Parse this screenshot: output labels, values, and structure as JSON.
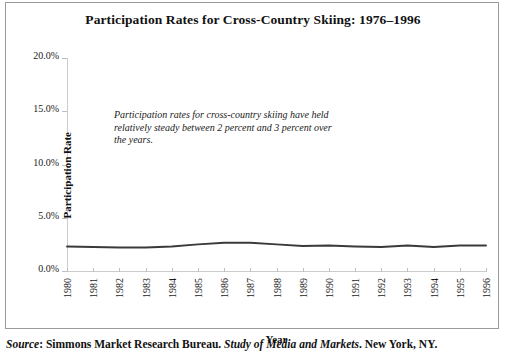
{
  "chart_data": {
    "type": "line",
    "title": "Participation Rates for Cross-Country Skiing: 1976–1996",
    "xlabel": "Year",
    "ylabel": "Participation Rate",
    "categories": [
      "1980",
      "1981",
      "1982",
      "1983",
      "1984",
      "1985",
      "1986",
      "1987",
      "1988",
      "1989",
      "1990",
      "1991",
      "1992",
      "1993",
      "1994",
      "1995",
      "1996"
    ],
    "x": [
      1980,
      1981,
      1982,
      1983,
      1984,
      1985,
      1986,
      1987,
      1988,
      1989,
      1990,
      1991,
      1992,
      1993,
      1994,
      1995,
      1996
    ],
    "series": [
      {
        "name": "Participation Rate",
        "values": [
          2.3,
          2.25,
          2.2,
          2.2,
          2.3,
          2.5,
          2.65,
          2.65,
          2.5,
          2.35,
          2.4,
          2.3,
          2.25,
          2.4,
          2.25,
          2.4,
          2.4
        ]
      }
    ],
    "ylim": [
      0,
      20
    ],
    "yticks": [
      0,
      5,
      10,
      15,
      20
    ],
    "ytick_labels": [
      "0.0%",
      "5.0%",
      "10.0%",
      "15.0%",
      "20.0%"
    ],
    "grid": false,
    "legend": "none",
    "line_color": "#3a3a3a",
    "annotations": [
      "Participation rates for cross-country skiing have held relatively steady between 2 percent and 3 percent over the years."
    ]
  },
  "source": {
    "label": "Source",
    "colon": ": ",
    "publisher": "Simmons Market Research Bureau. ",
    "work": "Study of Media and Markets",
    "location": ". New York, NY."
  }
}
